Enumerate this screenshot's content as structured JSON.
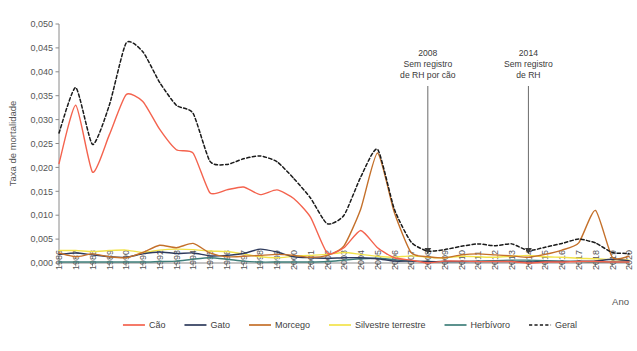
{
  "figure": {
    "ylabel": "Taxa de mortalidade",
    "xlabel": "Ano",
    "caption": ""
  },
  "annotations": [
    {
      "id": "ann-2008",
      "year": 2008,
      "line1": "2008",
      "line2": "Sem registro",
      "line3": "de RH por cão"
    },
    {
      "id": "ann-2014",
      "year": 2014,
      "line1": "2014",
      "line2": "Sem registro",
      "line3": "de RH"
    }
  ],
  "legend": {
    "items": [
      {
        "label": "Cão",
        "color": "#F4634E",
        "dashed": false
      },
      {
        "label": "Gato",
        "color": "#2E3A5C",
        "dashed": false
      },
      {
        "label": "Morcego",
        "color": "#C4702A",
        "dashed": false
      },
      {
        "label": "Silvestre terrestre",
        "color": "#F2E34A",
        "dashed": false
      },
      {
        "label": "Herbívoro",
        "color": "#3F7F7A",
        "dashed": false
      },
      {
        "label": "Geral",
        "color": "#1A1A1A",
        "dashed": true
      }
    ]
  },
  "chart_data": {
    "type": "line",
    "title": "",
    "xlabel": "Ano",
    "ylabel": "Taxa de mortalidade",
    "xlim": [
      1986,
      2020
    ],
    "ylim": [
      0.0,
      0.05
    ],
    "ytick_labels": [
      "0,000",
      "0,005",
      "0,010",
      "0,015",
      "0,020",
      "0,025",
      "0,030",
      "0,035",
      "0,040",
      "0,045",
      "0,050"
    ],
    "ytick_values": [
      0.0,
      0.005,
      0.01,
      0.015,
      0.02,
      0.025,
      0.03,
      0.035,
      0.04,
      0.045,
      0.05
    ],
    "grid": false,
    "legend_position": "bottom",
    "categories": [
      1986,
      1987,
      1988,
      1989,
      1990,
      1991,
      1992,
      1993,
      1994,
      1995,
      1996,
      1997,
      1998,
      1999,
      2000,
      2001,
      2002,
      2003,
      2004,
      2005,
      2006,
      2007,
      2008,
      2009,
      2010,
      2011,
      2012,
      2013,
      2014,
      2015,
      2016,
      2017,
      2018,
      2019,
      2020
    ],
    "series": [
      {
        "name": "Cão",
        "color": "#F4634E",
        "dashed": false,
        "values": [
          0.0208,
          0.033,
          0.019,
          0.0268,
          0.0352,
          0.0338,
          0.028,
          0.0237,
          0.023,
          0.0147,
          0.0153,
          0.0159,
          0.0143,
          0.0153,
          0.0135,
          0.0096,
          0.0021,
          0.0032,
          0.0068,
          0.0032,
          0.0011,
          0.0006,
          0.0,
          0.0004,
          0.0004,
          0.0003,
          0.0003,
          0.0003,
          0.0,
          0.0002,
          0.0002,
          0.0003,
          0.0003,
          0.0002,
          0.0002
        ]
      },
      {
        "name": "Gato",
        "color": "#2E3A5C",
        "dashed": false,
        "values": [
          0.0018,
          0.0021,
          0.0017,
          0.0013,
          0.0012,
          0.0019,
          0.0023,
          0.002,
          0.0021,
          0.0015,
          0.0016,
          0.002,
          0.0029,
          0.0023,
          0.0013,
          0.0011,
          0.001,
          0.0011,
          0.0011,
          0.0009,
          0.0004,
          0.0004,
          0.0003,
          0.0003,
          0.0003,
          0.0003,
          0.0003,
          0.0003,
          0.0002,
          0.0003,
          0.0003,
          0.0004,
          0.0004,
          0.0008,
          0.0005
        ]
      },
      {
        "name": "Morcego",
        "color": "#C4702A",
        "dashed": false,
        "values": [
          0.0021,
          0.0013,
          0.0019,
          0.0013,
          0.0011,
          0.0022,
          0.0037,
          0.0032,
          0.0041,
          0.0021,
          0.0013,
          0.0014,
          0.0016,
          0.0018,
          0.0016,
          0.0012,
          0.0016,
          0.0036,
          0.0113,
          0.023,
          0.0106,
          0.0022,
          0.0013,
          0.0011,
          0.0017,
          0.0019,
          0.0017,
          0.0015,
          0.0012,
          0.0018,
          0.0027,
          0.0042,
          0.011,
          0.0012,
          0.0014
        ]
      },
      {
        "name": "Silvestre terrestre",
        "color": "#F2E34A",
        "dashed": false,
        "values": [
          0.0026,
          0.0026,
          0.0024,
          0.0026,
          0.0027,
          0.0022,
          0.0027,
          0.0029,
          0.0028,
          0.0025,
          0.0024,
          0.0019,
          0.0013,
          0.0011,
          0.0014,
          0.0016,
          0.0018,
          0.0022,
          0.0018,
          0.0014,
          0.0012,
          0.0015,
          0.0012,
          0.0011,
          0.0014,
          0.0013,
          0.0012,
          0.0014,
          0.0016,
          0.0013,
          0.0012,
          0.001,
          0.0009,
          0.0007,
          0.0006
        ]
      },
      {
        "name": "Herbívoro",
        "color": "#3F7F7A",
        "dashed": false,
        "values": [
          0.0002,
          0.0002,
          0.0002,
          0.0002,
          0.0002,
          0.0002,
          0.0003,
          0.0004,
          0.0008,
          0.0011,
          0.0008,
          0.0004,
          0.0002,
          0.0002,
          0.0002,
          0.0002,
          0.0003,
          0.0006,
          0.0009,
          0.001,
          0.0007,
          0.0004,
          0.0003,
          0.0003,
          0.0003,
          0.0004,
          0.0005,
          0.0006,
          0.0006,
          0.0005,
          0.0004,
          0.0003,
          0.0002,
          0.0002,
          0.0002
        ]
      },
      {
        "name": "Geral",
        "color": "#1A1A1A",
        "dashed": true,
        "values": [
          0.0272,
          0.0367,
          0.0248,
          0.033,
          0.046,
          0.0442,
          0.0378,
          0.033,
          0.0313,
          0.0213,
          0.0206,
          0.0218,
          0.0224,
          0.0212,
          0.0177,
          0.0136,
          0.0082,
          0.01,
          0.018,
          0.0238,
          0.0113,
          0.0044,
          0.0025,
          0.0028,
          0.0035,
          0.004,
          0.0036,
          0.004,
          0.0026,
          0.0033,
          0.0041,
          0.005,
          0.0042,
          0.0022,
          0.002
        ]
      }
    ]
  }
}
